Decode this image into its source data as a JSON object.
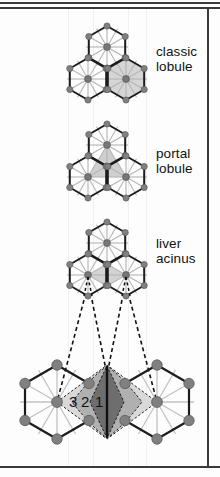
{
  "figure": {
    "background_color": "#fdfdfd",
    "frame_color": "#3a3a3a",
    "panels": [
      {
        "id": "classic-lobule",
        "label_line1": "classic",
        "label_line2": "lobule",
        "highlight": "one full hexagon shaded grey (central vein at centre)",
        "highlight_color": "#d5d5d5"
      },
      {
        "id": "portal-lobule",
        "label_line1": "portal",
        "label_line2": "lobule",
        "highlight": "triangle joining three hexagon centres shaded grey",
        "highlight_color": "#cfcfcf"
      },
      {
        "id": "liver-acinus",
        "label_line1": "liver",
        "label_line2": "acinus",
        "highlight": "rhomboid lens between two adjacent hexagon centres",
        "highlight_color": "#d2d2d2"
      },
      {
        "id": "acinus-zones",
        "label_line1": "",
        "label_line2": "",
        "highlight": "enlarged acinus with three concentric zones",
        "zone_labels": [
          "3",
          "2",
          "1"
        ],
        "zone_colors": [
          "#d9d9d9",
          "#b0b0b0",
          "#6e6e6e"
        ]
      }
    ],
    "node_color": "#808080",
    "node_outline": "#5a5a5a",
    "hexagon_edge_color": "#1c1c1c",
    "spoke_color": "#b5b5b5",
    "dashed_line_color": "#111111"
  }
}
